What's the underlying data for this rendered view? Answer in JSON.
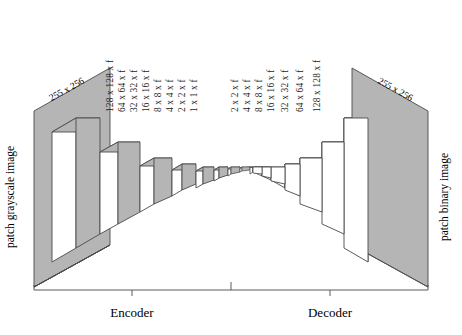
{
  "figure": {
    "type": "encoder-decoder-autoencoder-architecture",
    "input_label": "patch grayscale image",
    "output_label": "patch binary image",
    "input_dim_label": "255 x 256",
    "output_dim_label": "255 x 256",
    "encoder_label": "Encoder",
    "decoder_label": "Decoder",
    "colors": {
      "face_fill": "#ffffff",
      "shade_fill": "#b5b5b5",
      "stroke": "#4a4a4a",
      "text": "#1a1a1a"
    }
  },
  "encoder_layers": [
    {
      "label": "128 x 128 x f"
    },
    {
      "label": "64 x 64 x f"
    },
    {
      "label": "32 x 32 x f"
    },
    {
      "label": "16 x 16 x f"
    },
    {
      "label": "8 x 8 x f"
    },
    {
      "label": "4 x 4 x f"
    },
    {
      "label": "2 x 2 x f"
    },
    {
      "label": "1 x 1 x f"
    }
  ],
  "decoder_layers": [
    {
      "label": "2 x 2 x f"
    },
    {
      "label": "4 x 4 x f"
    },
    {
      "label": "8 x 8 x f"
    },
    {
      "label": "16 x 16 x f"
    },
    {
      "label": "32 x 32 x f"
    },
    {
      "label": "64 x 64 x f"
    },
    {
      "label": "128 x 128 x f"
    }
  ]
}
